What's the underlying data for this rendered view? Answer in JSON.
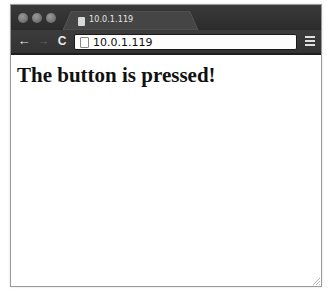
{
  "window": {
    "traffic_lights": [
      "close",
      "minimize",
      "zoom"
    ]
  },
  "tab": {
    "title": "10.0.1.119",
    "icon": "page-icon"
  },
  "toolbar": {
    "back_icon": "←",
    "forward_icon": "→",
    "reload_icon": "C",
    "url": "10.0.1.119",
    "menu_icon": "hamburger-menu-icon"
  },
  "page": {
    "heading": "The button is pressed!"
  },
  "colors": {
    "chrome_dark": "#2f2f2f",
    "tab_active": "#3f3f3f",
    "page_background": "#ffffff",
    "heading_text": "#111111"
  }
}
